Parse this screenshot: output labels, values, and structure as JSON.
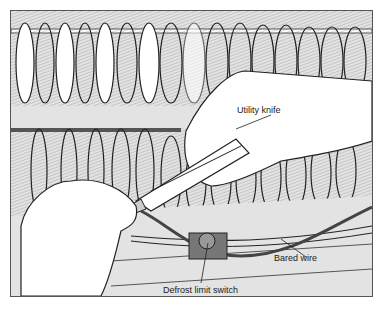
{
  "figure": {
    "type": "technical illustration",
    "colors": {
      "background": "#e3e3e3",
      "ink": "#222222",
      "paper": "#ffffff",
      "switch": "#777777"
    },
    "labels": [
      {
        "id": "utility-knife",
        "text": "Utility knife"
      },
      {
        "id": "bared-wire",
        "text": "Bared wire"
      },
      {
        "id": "defrost-limit-switch",
        "text": "Defrost limit switch"
      }
    ]
  }
}
